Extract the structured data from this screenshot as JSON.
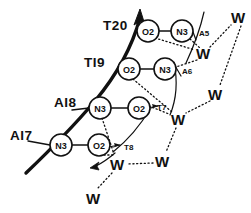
{
  "figure": {
    "colors": {
      "ink": "#111111",
      "background": "#ffffff"
    },
    "residues": [
      {
        "id": "t20",
        "label": "T20",
        "x": 103,
        "y": 30
      },
      {
        "id": "t19",
        "label": "TI9",
        "x": 84,
        "y": 67
      },
      {
        "id": "a18",
        "label": "AI8",
        "x": 54,
        "y": 107
      },
      {
        "id": "a17",
        "label": "AI7",
        "x": 10,
        "y": 140
      }
    ],
    "atoms": [
      {
        "id": "o2-t20",
        "label": "O2",
        "x": 148,
        "y": 31,
        "r": 11
      },
      {
        "id": "n3-t20",
        "label": "N3",
        "x": 182,
        "y": 31,
        "r": 11
      },
      {
        "id": "o2-t19",
        "label": "O2",
        "x": 129,
        "y": 69,
        "r": 11
      },
      {
        "id": "n3-t19",
        "label": "N3",
        "x": 165,
        "y": 69,
        "r": 11
      },
      {
        "id": "n3-a18",
        "label": "N3",
        "x": 100,
        "y": 108,
        "r": 11
      },
      {
        "id": "o2-a18",
        "label": "O2",
        "x": 139,
        "y": 108,
        "r": 11
      },
      {
        "id": "n3-a17",
        "label": "N3",
        "x": 61,
        "y": 145,
        "r": 11
      },
      {
        "id": "o2-a17",
        "label": "O2",
        "x": 99,
        "y": 145,
        "r": 11
      }
    ],
    "aux_labels": [
      {
        "id": "a5",
        "label": "A5",
        "x": 199,
        "y": 36
      },
      {
        "id": "a6",
        "label": "A6",
        "x": 182,
        "y": 74
      },
      {
        "id": "t7",
        "label": "T7",
        "x": 157,
        "y": 110
      },
      {
        "id": "t8",
        "label": "T8",
        "x": 124,
        "y": 150
      }
    ],
    "waters": [
      {
        "id": "w-top-right",
        "label": "W",
        "x": 238,
        "y": 17
      },
      {
        "id": "w-upper-mid",
        "label": "W",
        "x": 203,
        "y": 53
      },
      {
        "id": "w-right-mid",
        "label": "W",
        "x": 215,
        "y": 94
      },
      {
        "id": "w-center-right",
        "label": "W",
        "x": 178,
        "y": 119
      },
      {
        "id": "w-lower-right",
        "label": "W",
        "x": 162,
        "y": 161
      },
      {
        "id": "w-lower-mid",
        "label": "W",
        "x": 117,
        "y": 164
      },
      {
        "id": "w-bottom",
        "label": "W",
        "x": 93,
        "y": 198
      }
    ],
    "covalent_bonds": [
      {
        "from": "o2-t20",
        "to": "n3-t20"
      },
      {
        "from": "o2-t19",
        "to": "n3-t19"
      },
      {
        "from": "n3-a18",
        "to": "o2-a18"
      },
      {
        "from": "n3-a17",
        "to": "o2-a17"
      }
    ],
    "hydrogen_bonds": [
      {
        "from": "n3-t20",
        "to": "w-upper-mid"
      },
      {
        "from": "o2-t20",
        "to": "w-upper-mid"
      },
      {
        "from": "w-upper-mid",
        "to": "w-top-right"
      },
      {
        "from": "w-upper-mid",
        "to": "n3-t19"
      },
      {
        "from": "w-top-right",
        "to": "w-right-mid"
      },
      {
        "from": "w-right-mid",
        "to": "w-center-right"
      },
      {
        "from": "o2-t19",
        "to": "w-center-right"
      },
      {
        "from": "o2-a18",
        "to": "w-center-right"
      },
      {
        "from": "w-center-right",
        "to": "w-lower-right"
      },
      {
        "from": "w-lower-right",
        "to": "w-lower-mid"
      },
      {
        "from": "n3-a18",
        "to": "w-lower-mid"
      },
      {
        "from": "o2-a17",
        "to": "w-lower-mid"
      },
      {
        "from": "w-lower-mid",
        "to": "w-bottom"
      }
    ],
    "backbone": {
      "description": "thick arrowed helical backbone trace",
      "arrow_head": "up"
    }
  }
}
